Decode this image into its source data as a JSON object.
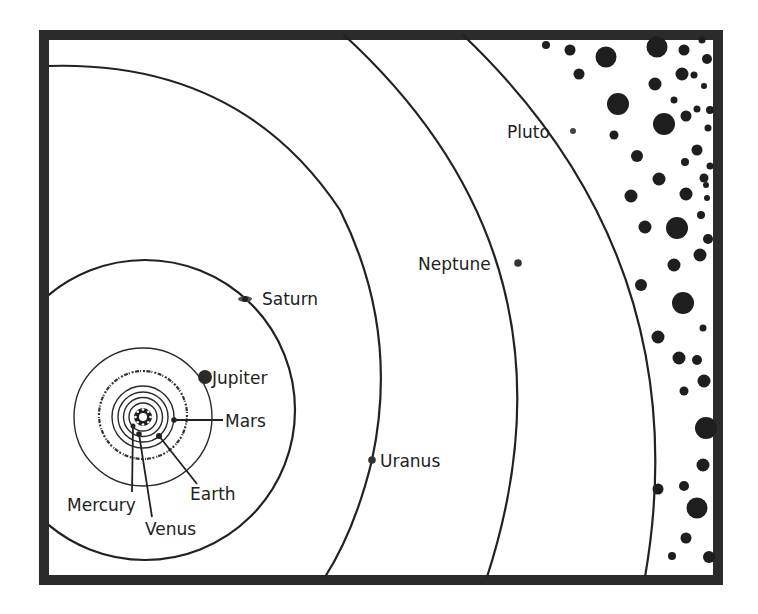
{
  "diagram": {
    "frame_color": "#2b2b2b",
    "planets": [
      {
        "name": "Mercury",
        "label": "Mercury"
      },
      {
        "name": "Venus",
        "label": "Venus"
      },
      {
        "name": "Earth",
        "label": "Earth"
      },
      {
        "name": "Mars",
        "label": "Mars"
      },
      {
        "name": "Jupiter",
        "label": "Jupiter"
      },
      {
        "name": "Saturn",
        "label": "Saturn"
      },
      {
        "name": "Uranus",
        "label": "Uranus"
      },
      {
        "name": "Neptune",
        "label": "Neptune"
      },
      {
        "name": "Pluto",
        "label": "Pluto"
      }
    ],
    "regions": {
      "asteroid_belt": "asteroid-belt-between-mars-and-jupiter",
      "kuiper_field": "dotted-field-beyond-pluto"
    }
  }
}
